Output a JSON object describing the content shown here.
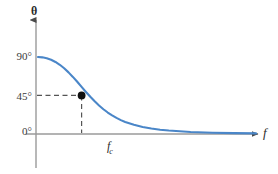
{
  "figure": {
    "background_color": "#ffffff",
    "curve_color": "#4a86c8",
    "axis_color": "#9a9a9a",
    "dash_color": "#555555",
    "marker_color": "#111111"
  },
  "axes": {
    "y_axis_label": "θ",
    "x_axis_label": "f",
    "y_tick_labels": [
      "90°",
      "45°",
      "0°"
    ],
    "x_tick_labels": [
      "f",
      "c"
    ],
    "x_tick_label_main": "f",
    "x_tick_label_sub": "c"
  },
  "chart_data": {
    "type": "line",
    "title": "",
    "subtitle": "",
    "xlabel": "f",
    "ylabel": "θ",
    "grid": false,
    "legend": null,
    "xlim": [
      0,
      5
    ],
    "ylim": [
      0,
      100
    ],
    "yticks": [
      0,
      45,
      90
    ],
    "ytick_labels": [
      "0°",
      "45°",
      "90°"
    ],
    "xticks": [
      1
    ],
    "xtick_labels": [
      "f_c"
    ],
    "series": [
      {
        "name": "phase response",
        "color": "#4a86c8",
        "x": [
          0.0,
          0.1,
          0.2,
          0.3,
          0.4,
          0.5,
          0.6,
          0.7,
          0.8,
          0.9,
          1.0,
          1.1,
          1.2,
          1.3,
          1.4,
          1.5,
          1.6,
          1.7,
          1.8,
          1.9,
          2.0,
          2.2,
          2.4,
          2.6,
          2.8,
          3.0,
          3.5,
          4.0,
          4.5,
          5.0
        ],
        "values": [
          90.0,
          89.6,
          88.6,
          86.8,
          84.2,
          80.9,
          76.8,
          72.0,
          66.7,
          61.0,
          55.0,
          49.1,
          43.4,
          38.1,
          33.2,
          28.9,
          25.0,
          21.6,
          18.7,
          16.1,
          13.9,
          10.6,
          8.1,
          6.3,
          4.9,
          3.9,
          2.3,
          1.4,
          0.9,
          0.6
        ]
      }
    ],
    "annotations": [
      {
        "type": "point-marker",
        "label": "cutoff point",
        "x": 1.0,
        "y": 45,
        "x_label": "f_c",
        "y_label": "45°",
        "marker": "filled-circle",
        "color": "#111111"
      },
      {
        "type": "dashed-guide-horizontal",
        "label": "45-degree guide",
        "y": 45,
        "from_x": 0,
        "to_x": 1.0
      },
      {
        "type": "dashed-guide-vertical",
        "label": "cutoff-frequency-guide",
        "x": 1.0,
        "from_y": 0,
        "to_y": 45
      }
    ]
  }
}
